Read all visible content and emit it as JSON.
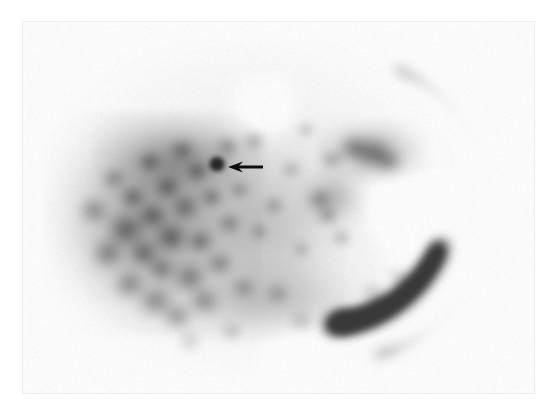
{
  "page": {
    "background_color": "#ffffff",
    "width": 556,
    "height": 418
  },
  "scan": {
    "frame": {
      "x": 22,
      "y": 21,
      "width": 511,
      "height": 371,
      "border_color": "#ededee",
      "plate_color": "#fbfbfb"
    },
    "modality": "nuclear-medicine-scintigraphy",
    "colormap": "grayscale-inverted",
    "background_intensity": "#fdfdfd",
    "max_uptake_color": "#4f4f4f",
    "mid_uptake_color": "#8d8d8d",
    "low_uptake_color": "#d8d8d8"
  },
  "annotation": {
    "arrow": {
      "icon": "arrow-left-icon",
      "color": "#0d0d0d",
      "tail_x": 262,
      "head_x": 227,
      "y": 166,
      "shaft_width": 3,
      "head_width": 11,
      "head_height": 15
    },
    "focus_spot": {
      "cx": 216,
      "cy": 163,
      "r": 7,
      "color": "#1f1f1f"
    }
  },
  "chart_data": {
    "type": "heatmap",
    "title": "",
    "xlabel": "",
    "ylabel": "",
    "colormap": "grayscale-inverted",
    "notes": "Planar nuclear-medicine emission image; darker = higher radiotracer uptake.",
    "body_outline": {
      "cx": 248,
      "cy": 205,
      "rx": 200,
      "ry": 165,
      "edge_softness": 46
    },
    "regions": [
      {
        "name": "diffuse-body-halo",
        "cx": 248,
        "cy": 205,
        "rx": 205,
        "ry": 168,
        "intensity": 0.1,
        "blur": 40
      },
      {
        "name": "left-marrow-field",
        "cx": 152,
        "cy": 222,
        "rx": 108,
        "ry": 112,
        "intensity": 0.4,
        "blur": 30
      },
      {
        "name": "upper-left-field",
        "cx": 178,
        "cy": 158,
        "rx": 86,
        "ry": 44,
        "intensity": 0.3,
        "blur": 26
      },
      {
        "name": "central-field",
        "cx": 268,
        "cy": 232,
        "rx": 76,
        "ry": 104,
        "intensity": 0.18,
        "blur": 30
      },
      {
        "name": "right-upper-mass",
        "cx": 371,
        "cy": 150,
        "rx": 56,
        "ry": 32,
        "intensity": 0.32,
        "blur": 22
      },
      {
        "name": "right-mid-band",
        "cx": 331,
        "cy": 196,
        "rx": 34,
        "ry": 30,
        "intensity": 0.24,
        "blur": 20
      },
      {
        "name": "lower-central-band",
        "cx": 268,
        "cy": 300,
        "rx": 110,
        "ry": 42,
        "intensity": 0.18,
        "blur": 28
      },
      {
        "name": "right-rib-arc",
        "type": "arc",
        "cx": 352,
        "cy": 208,
        "r": 150,
        "start_deg": -72,
        "end_deg": 80,
        "thickness": 13,
        "intensity": 0.22,
        "blur": 9
      },
      {
        "name": "right-lower-arc",
        "type": "arc",
        "cx": 322,
        "cy": 196,
        "r": 128,
        "start_deg": 22,
        "end_deg": 86,
        "thickness": 16,
        "intensity": 0.24,
        "blur": 10
      }
    ],
    "hot_blobs": [
      {
        "cx": 92,
        "cy": 209,
        "r": 17,
        "i": 0.3
      },
      {
        "cx": 106,
        "cy": 252,
        "r": 19,
        "i": 0.33
      },
      {
        "cx": 112,
        "cy": 177,
        "r": 14,
        "i": 0.26
      },
      {
        "cx": 124,
        "cy": 228,
        "r": 21,
        "i": 0.36
      },
      {
        "cx": 128,
        "cy": 283,
        "r": 18,
        "i": 0.32
      },
      {
        "cx": 131,
        "cy": 196,
        "r": 15,
        "i": 0.3
      },
      {
        "cx": 142,
        "cy": 252,
        "r": 17,
        "i": 0.33
      },
      {
        "cx": 148,
        "cy": 160,
        "r": 13,
        "i": 0.27
      },
      {
        "cx": 151,
        "cy": 214,
        "r": 16,
        "i": 0.32
      },
      {
        "cx": 154,
        "cy": 300,
        "r": 20,
        "i": 0.35
      },
      {
        "cx": 160,
        "cy": 268,
        "r": 16,
        "i": 0.3
      },
      {
        "cx": 166,
        "cy": 186,
        "r": 14,
        "i": 0.29
      },
      {
        "cx": 170,
        "cy": 236,
        "r": 18,
        "i": 0.34
      },
      {
        "cx": 176,
        "cy": 315,
        "r": 17,
        "i": 0.31
      },
      {
        "cx": 181,
        "cy": 148,
        "r": 14,
        "i": 0.26
      },
      {
        "cx": 184,
        "cy": 206,
        "r": 16,
        "i": 0.31
      },
      {
        "cx": 188,
        "cy": 276,
        "r": 19,
        "i": 0.33
      },
      {
        "cx": 196,
        "cy": 170,
        "r": 13,
        "i": 0.27
      },
      {
        "cx": 199,
        "cy": 240,
        "r": 15,
        "i": 0.31
      },
      {
        "cx": 203,
        "cy": 300,
        "r": 17,
        "i": 0.3
      },
      {
        "cx": 210,
        "cy": 196,
        "r": 13,
        "i": 0.28
      },
      {
        "cx": 216,
        "cy": 163,
        "r": 9,
        "i": 0.62
      },
      {
        "cx": 218,
        "cy": 262,
        "r": 15,
        "i": 0.28
      },
      {
        "cx": 226,
        "cy": 145,
        "r": 14,
        "i": 0.26
      },
      {
        "cx": 228,
        "cy": 222,
        "r": 13,
        "i": 0.26
      },
      {
        "cx": 238,
        "cy": 188,
        "r": 12,
        "i": 0.22
      },
      {
        "cx": 242,
        "cy": 286,
        "r": 14,
        "i": 0.22
      },
      {
        "cx": 252,
        "cy": 140,
        "r": 13,
        "i": 0.24
      },
      {
        "cx": 258,
        "cy": 230,
        "r": 11,
        "i": 0.2
      },
      {
        "cx": 272,
        "cy": 204,
        "r": 12,
        "i": 0.22
      },
      {
        "cx": 276,
        "cy": 292,
        "r": 13,
        "i": 0.2
      },
      {
        "cx": 290,
        "cy": 168,
        "r": 12,
        "i": 0.2
      },
      {
        "cx": 300,
        "cy": 248,
        "r": 11,
        "i": 0.18
      },
      {
        "cx": 304,
        "cy": 128,
        "r": 11,
        "i": 0.2
      },
      {
        "cx": 318,
        "cy": 198,
        "r": 14,
        "i": 0.26
      },
      {
        "cx": 326,
        "cy": 214,
        "r": 12,
        "i": 0.25
      },
      {
        "cx": 330,
        "cy": 158,
        "r": 13,
        "i": 0.24
      },
      {
        "cx": 340,
        "cy": 236,
        "r": 12,
        "i": 0.22
      },
      {
        "cx": 352,
        "cy": 146,
        "r": 17,
        "i": 0.3
      },
      {
        "cx": 372,
        "cy": 152,
        "r": 20,
        "i": 0.32
      },
      {
        "cx": 388,
        "cy": 160,
        "r": 16,
        "i": 0.27
      },
      {
        "cx": 300,
        "cy": 320,
        "r": 14,
        "i": 0.18
      },
      {
        "cx": 340,
        "cy": 310,
        "r": 13,
        "i": 0.17
      },
      {
        "cx": 372,
        "cy": 292,
        "r": 14,
        "i": 0.19
      },
      {
        "cx": 398,
        "cy": 276,
        "r": 13,
        "i": 0.18
      },
      {
        "cx": 230,
        "cy": 330,
        "r": 13,
        "i": 0.17
      },
      {
        "cx": 188,
        "cy": 340,
        "r": 14,
        "i": 0.18
      }
    ],
    "cold_blobs": [
      {
        "cx": 420,
        "cy": 218,
        "r": 50,
        "i": 0.16
      },
      {
        "cx": 392,
        "cy": 206,
        "r": 34,
        "i": 0.12
      },
      {
        "cx": 262,
        "cy": 110,
        "r": 40,
        "i": 0.1
      },
      {
        "cx": 300,
        "cy": 352,
        "r": 44,
        "i": 0.12
      }
    ]
  }
}
